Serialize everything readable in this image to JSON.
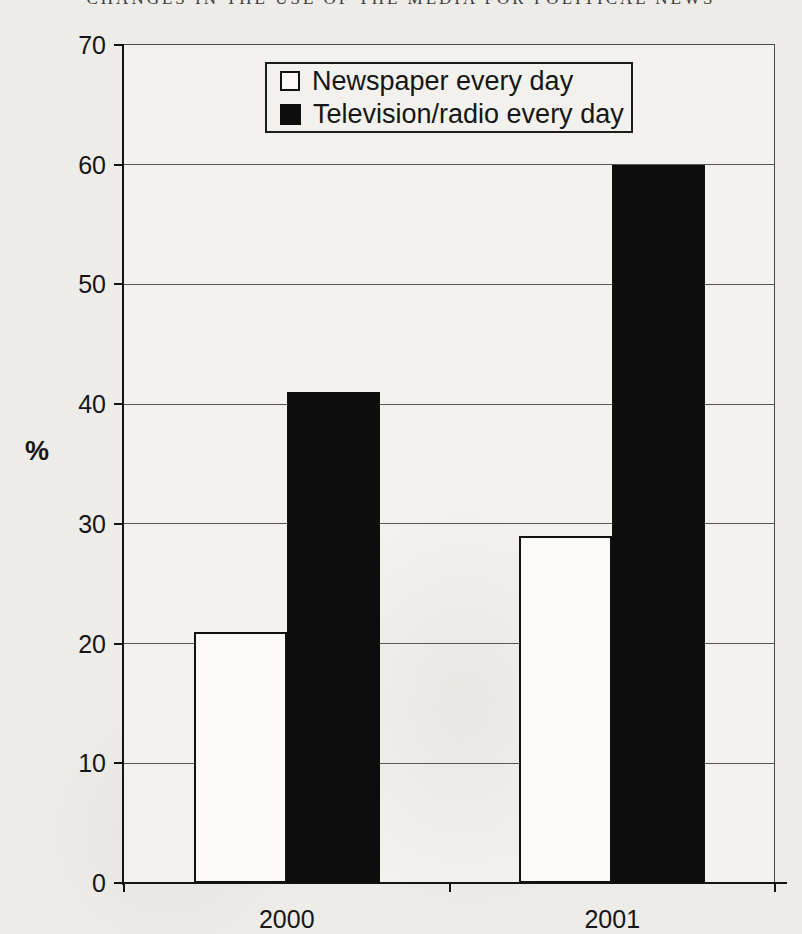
{
  "page": {
    "header_title": "CHANGES IN THE USE OF THE MEDIA FOR POLITICAL NEWS"
  },
  "chart_data": {
    "type": "bar",
    "title": "CHANGES IN THE USE OF THE MEDIA FOR POLITICAL NEWS",
    "categories": [
      "2000",
      "2001"
    ],
    "series": [
      {
        "name": "Newspaper every day",
        "values": [
          21,
          29
        ],
        "style": "white"
      },
      {
        "name": "Television/radio every day",
        "values": [
          41,
          60
        ],
        "style": "black"
      }
    ],
    "ylabel": "%",
    "ylim": [
      0,
      70
    ],
    "ytick_step": 10,
    "yticks": [
      0,
      10,
      20,
      30,
      40,
      50,
      60,
      70
    ],
    "grid": true,
    "legend_position": "top-center",
    "colors": {
      "white_bar": "#fbfaf7",
      "black_bar": "#0d0d0d",
      "bar_border": "#111111",
      "page_background": "#edece8"
    }
  }
}
